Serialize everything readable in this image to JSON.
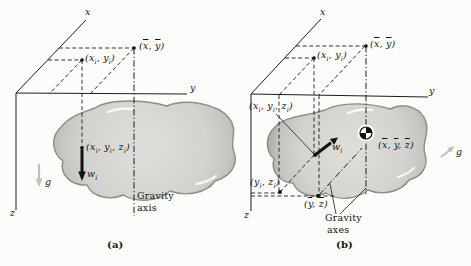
{
  "figure": {
    "panels": [
      {
        "id": "a",
        "caption": "(a)",
        "axes": {
          "x": "x",
          "y": "y",
          "z": "z"
        },
        "labels": {
          "mean_xy": "(~x, ~y)",
          "particle_xy": "(x_i, y_i)",
          "particle_xyz": "(x_i, y_i, z_i)",
          "particle_weight": "w_i",
          "gravity_g": "g",
          "gravity_axis": [
            "Gravity",
            "axis"
          ]
        }
      },
      {
        "id": "b",
        "caption": "(b)",
        "axes": {
          "x": "x",
          "y": "y",
          "z": "z"
        },
        "labels": {
          "mean_xy": "(~x, ~y)",
          "particle_xy": "(x_i, y_i)",
          "particle_xyz": "(x_i, y_i, z_i)",
          "particle_weight": "w_i",
          "center_of_gravity": "(~x, ~y, ~z)",
          "particle_yz": "(y_i, z_i)",
          "mean_yz": "(~y, ~z)",
          "gravity_g": "g",
          "gravity_axes": [
            "Gravity",
            "axes"
          ]
        }
      }
    ],
    "colors": {
      "line": "#1c1c1c",
      "blob_fill": "#d3d4cf",
      "blob_edge": "#8d8e88",
      "gravity_arrow": "#bfbfbb",
      "background": "#fcfcfa"
    }
  }
}
